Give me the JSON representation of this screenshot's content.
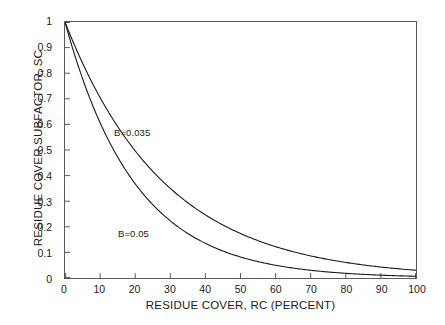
{
  "chart_data": {
    "type": "line",
    "title": "",
    "xlabel": "RESIDUE COVER, RC (PERCENT)",
    "ylabel": "RESIDUE COVER SUBFACTOR, SC",
    "xlim": [
      0,
      100
    ],
    "ylim": [
      0,
      1
    ],
    "grid": false,
    "legend_position": "inline-annotations",
    "xticks": [
      0,
      10,
      20,
      30,
      40,
      50,
      60,
      70,
      80,
      90,
      100
    ],
    "xtick_labels": [
      "0",
      "10",
      "20",
      "30",
      "40",
      "50",
      "60",
      "70",
      "80",
      "90",
      "100"
    ],
    "yticks": [
      0,
      0.1,
      0.2,
      0.3,
      0.4,
      0.5,
      0.6,
      0.7,
      0.8,
      0.9,
      1
    ],
    "ytick_labels": [
      "0",
      "0.1",
      "0.2",
      "0.3",
      "0.4",
      "0.5",
      "0.6",
      "0.7",
      "0.8",
      "0.9",
      "1"
    ],
    "equation": "SC = exp(-B * RC)",
    "x": [
      0,
      5,
      10,
      15,
      20,
      25,
      30,
      35,
      40,
      45,
      50,
      55,
      60,
      65,
      70,
      75,
      80,
      85,
      90,
      95,
      100
    ],
    "series": [
      {
        "name": "B=0.035",
        "label": "B=0.035",
        "color": "#1a1a1a",
        "values": [
          1,
          0.839,
          0.705,
          0.592,
          0.497,
          0.417,
          0.35,
          0.294,
          0.247,
          0.207,
          0.174,
          0.146,
          0.122,
          0.103,
          0.086,
          0.072,
          0.061,
          0.051,
          0.043,
          0.036,
          0.03
        ]
      },
      {
        "name": "B=0.05",
        "label": "B=0.05",
        "color": "#1a1a1a",
        "values": [
          1,
          0.779,
          0.607,
          0.472,
          0.368,
          0.287,
          0.223,
          0.174,
          0.135,
          0.105,
          0.082,
          0.064,
          0.05,
          0.039,
          0.03,
          0.024,
          0.018,
          0.014,
          0.011,
          0.009,
          0.007
        ]
      }
    ]
  },
  "annotations": {
    "upper_curve": "B=0.035",
    "lower_curve": "B=0.05"
  },
  "axes": {
    "x_title": "RESIDUE COVER, RC (PERCENT)",
    "y_title": "RESIDUE COVER SUBFACTOR, SC"
  },
  "colors": {
    "curve": "#1a1a1a",
    "frame": "#5a5a5a",
    "background": "#ffffff",
    "text": "#1a1a1a"
  }
}
